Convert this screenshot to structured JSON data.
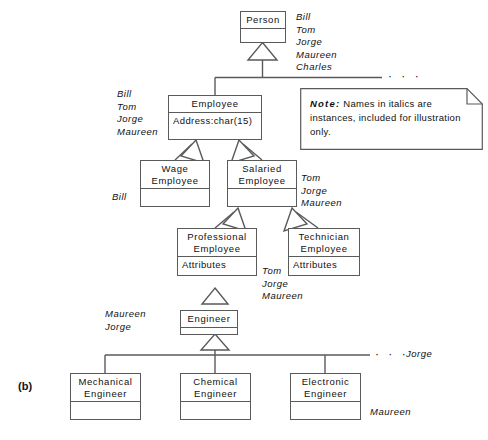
{
  "figure": {
    "caption": "(b)",
    "type": "uml-generalization-hierarchy"
  },
  "note": {
    "label": "Note:",
    "text": " Names in italics are instances, included for illustration only."
  },
  "classes": {
    "person": {
      "name": "Person",
      "attributes": ""
    },
    "employee": {
      "name": "Employee",
      "attributes": "Address:char(15)"
    },
    "wage": {
      "name": "Wage\nEmployee",
      "attributes": ""
    },
    "salaried": {
      "name": "Salaried\nEmployee",
      "attributes": ""
    },
    "professional": {
      "name": "Professional\nEmployee",
      "attributes": "Attributes"
    },
    "technician": {
      "name": "Technician\nEmployee",
      "attributes": "Attributes"
    },
    "engineer": {
      "name": "Engineer",
      "attributes": ""
    },
    "mechanical": {
      "name": "Mechanical\nEngineer",
      "attributes": ""
    },
    "chemical": {
      "name": "Chemical\nEngineer",
      "attributes": ""
    },
    "electronic": {
      "name": "Electronic\nEngineer",
      "attributes": ""
    }
  },
  "instances": {
    "person": "Bill\nTom\nJorge\nMaureen\nCharles",
    "employee": "Bill\nTom\nJorge\nMaureen",
    "wage": "Bill",
    "salaried": "Tom\nJorge\nMaureen",
    "professional": "Tom\nJorge\nMaureen",
    "engineer": "Maureen\nJorge",
    "engineer_subclasses": "Jorge",
    "electronic": "Maureen"
  },
  "ellipses": {
    "person_level": "· · ·",
    "engineer_level": "· · ·"
  },
  "colors": {
    "line": "#5a5a5a",
    "text": "#111111",
    "background": "#ffffff"
  }
}
